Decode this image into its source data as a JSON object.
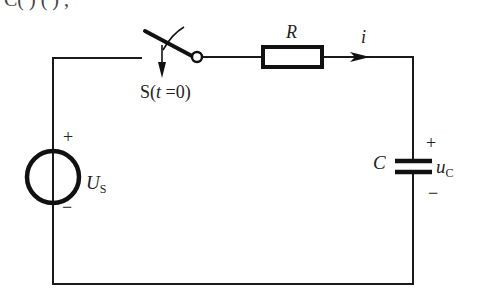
{
  "header_partial_text": "C( )    ( ) ,",
  "circuit": {
    "switch": {
      "label_prefix": "S(",
      "label_var": "t",
      "label_suffix": " =0)"
    },
    "resistor": {
      "label": "R"
    },
    "current": {
      "label": "i"
    },
    "source": {
      "plus": "+",
      "minus": "−",
      "label": "U",
      "label_sub": "S"
    },
    "capacitor": {
      "label": "C",
      "plus": "+",
      "minus": "−",
      "voltage_label": "u",
      "voltage_sub": "C"
    }
  }
}
